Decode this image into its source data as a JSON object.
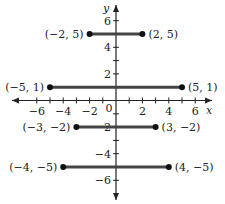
{
  "axes": {
    "x_label": "x",
    "y_label": "y",
    "origin_label": "0",
    "x_ticks": [
      -6,
      -5,
      -4,
      -3,
      -2,
      -1,
      1,
      2,
      3,
      4,
      5,
      6
    ],
    "x_tick_labels": [
      {
        "v": -6,
        "t": "−6"
      },
      {
        "v": -4,
        "t": "−4"
      },
      {
        "v": -2,
        "t": "−2"
      },
      {
        "v": 2,
        "t": "2"
      },
      {
        "v": 4,
        "t": "4"
      },
      {
        "v": 6,
        "t": "6"
      }
    ],
    "y_ticks": [
      -6,
      -5,
      -4,
      -3,
      -2,
      -1,
      1,
      2,
      3,
      4,
      5,
      6
    ],
    "y_tick_labels": [
      {
        "v": 6,
        "t": "6"
      },
      {
        "v": 4,
        "t": "4"
      },
      {
        "v": 2,
        "t": "2"
      },
      {
        "v": -2,
        "t": "−2"
      },
      {
        "v": -4,
        "t": "−4"
      },
      {
        "v": -6,
        "t": "−6"
      }
    ]
  },
  "segments": [
    {
      "y": 5,
      "x1": -2,
      "x2": 2,
      "left_label": "(−2, 5)",
      "right_label": "(2, 5)"
    },
    {
      "y": 1,
      "x1": -5,
      "x2": 5,
      "left_label": "(−5, 1)",
      "right_label": "(5, 1)"
    },
    {
      "y": -2,
      "x1": -3,
      "x2": 3,
      "left_label": "(−3, −2)",
      "right_label": "(3, −2)"
    },
    {
      "y": -5,
      "x1": -4,
      "x2": 4,
      "left_label": "(−4, −5)",
      "right_label": "(4, −5)"
    }
  ]
}
